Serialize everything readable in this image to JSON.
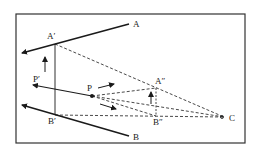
{
  "diagram": {
    "type": "geometric-perspective",
    "colors": {
      "line": "#1a1a1a",
      "frame": "#333333",
      "background": "#ffffff"
    },
    "points": {
      "A": {
        "label": "A",
        "x": 129,
        "y": 24
      },
      "A_prime": {
        "label": "A′",
        "x": 55,
        "y": 44
      },
      "A_dprime": {
        "label": "A″",
        "x": 156,
        "y": 88
      },
      "B": {
        "label": "B",
        "x": 129,
        "y": 136
      },
      "B_prime": {
        "label": "B′",
        "x": 55,
        "y": 115
      },
      "B_dprime": {
        "label": "B″",
        "x": 156,
        "y": 116
      },
      "P": {
        "label": "P",
        "x": 92,
        "y": 96
      },
      "P_prime": {
        "label": "P′",
        "x": 33,
        "y": 85
      },
      "C": {
        "label": "C",
        "x": 224,
        "y": 117
      }
    },
    "labels": {
      "A": "A",
      "A_prime": "A′",
      "A_dprime": "A″",
      "B": "B",
      "B_prime": "B′",
      "B_dprime": "B″",
      "P": "P",
      "P_prime": "P′",
      "C": "C"
    }
  }
}
